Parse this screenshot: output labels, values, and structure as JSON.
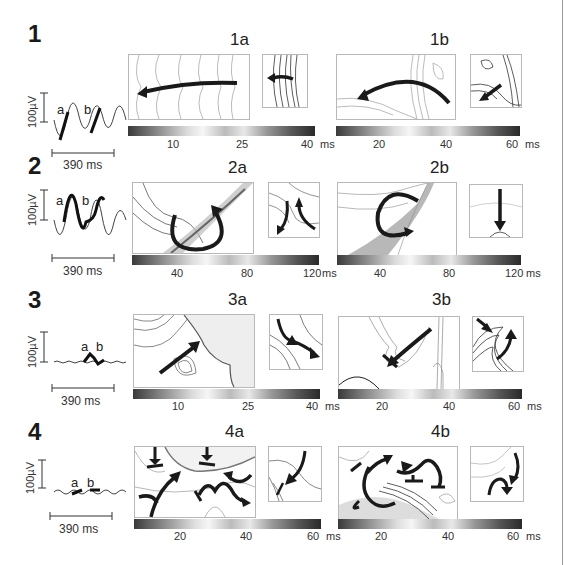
{
  "figure": {
    "rows": [
      {
        "number": "1",
        "trace": {
          "scale_label": "100µV",
          "time_label": "390 ms",
          "letter_a": "a",
          "letter_b": "b"
        },
        "panels": [
          {
            "title": "1a",
            "colorbar": {
              "ticks": [
                "10",
                "25",
                "40"
              ],
              "unit": "ms",
              "range_ms": [
                0,
                40
              ]
            }
          },
          {
            "title": "1b",
            "colorbar": {
              "ticks": [
                "20",
                "40",
                "60"
              ],
              "unit": "ms",
              "range_ms": [
                0,
                60
              ]
            }
          }
        ]
      },
      {
        "number": "2",
        "trace": {
          "scale_label": "100µV",
          "time_label": "390 ms",
          "letter_a": "a",
          "letter_b": "b"
        },
        "panels": [
          {
            "title": "2a",
            "colorbar": {
              "ticks": [
                "40",
                "80",
                "120"
              ],
              "unit": "ms",
              "range_ms": [
                0,
                120
              ]
            }
          },
          {
            "title": "2b",
            "colorbar": {
              "ticks": [
                "40",
                "80",
                "120"
              ],
              "unit": "ms",
              "range_ms": [
                0,
                120
              ]
            }
          }
        ]
      },
      {
        "number": "3",
        "trace": {
          "scale_label": "100µV",
          "time_label": "390 ms",
          "letter_a": "a",
          "letter_b": "b"
        },
        "panels": [
          {
            "title": "3a",
            "colorbar": {
              "ticks": [
                "10",
                "25",
                "40"
              ],
              "unit": "ms",
              "range_ms": [
                0,
                40
              ]
            }
          },
          {
            "title": "3b",
            "colorbar": {
              "ticks": [
                "20",
                "40",
                "60"
              ],
              "unit": "ms",
              "range_ms": [
                0,
                60
              ]
            }
          }
        ]
      },
      {
        "number": "4",
        "trace": {
          "scale_label": "100µV",
          "time_label": "390 ms",
          "letter_a": "a",
          "letter_b": "b"
        },
        "panels": [
          {
            "title": "4a",
            "colorbar": {
              "ticks": [
                "20",
                "40",
                "60"
              ],
              "unit": "ms",
              "range_ms": [
                0,
                60
              ]
            }
          },
          {
            "title": "4b",
            "colorbar": {
              "ticks": [
                "20",
                "40",
                "60"
              ],
              "unit": "ms",
              "range_ms": [
                0,
                60
              ]
            }
          }
        ]
      }
    ],
    "colors": {
      "arrow": "#1a1a1a",
      "contour_dark": "#333333",
      "contour_light": "#aaaaaa",
      "grid_dot": "#777777"
    }
  }
}
